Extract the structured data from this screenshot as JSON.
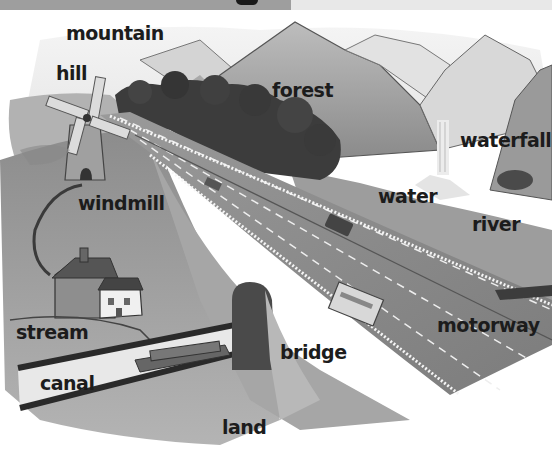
{
  "header": {
    "bar_left_color": "#9e9e9e",
    "bar_right_color": "#e8e8e8"
  },
  "illustration": {
    "description": "Landscape with mountains, forest, windmill, houses, canal, bridge and motorway",
    "labels": [
      {
        "id": "mountain",
        "text": "mountain"
      },
      {
        "id": "hill",
        "text": "hill"
      },
      {
        "id": "forest",
        "text": "forest"
      },
      {
        "id": "waterfall",
        "text": "waterfall"
      },
      {
        "id": "windmill",
        "text": "windmill"
      },
      {
        "id": "water",
        "text": "water"
      },
      {
        "id": "river",
        "text": "river"
      },
      {
        "id": "stream",
        "text": "stream"
      },
      {
        "id": "motorway",
        "text": "motorway"
      },
      {
        "id": "bridge",
        "text": "bridge"
      },
      {
        "id": "canal",
        "text": "canal"
      },
      {
        "id": "land",
        "text": "land"
      }
    ]
  }
}
